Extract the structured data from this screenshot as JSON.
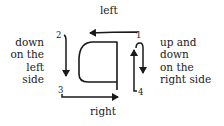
{
  "diagram": {
    "labels": {
      "top": "left",
      "bottom": "right",
      "left_side": [
        "down",
        "on the",
        "left",
        "side"
      ],
      "right_side": [
        "up and",
        "down",
        "on the",
        "right side"
      ]
    },
    "stroke_numbers": [
      "1",
      "2",
      "3",
      "4"
    ],
    "strokes": [
      {
        "number": "1",
        "direction": "left",
        "description": "arrow along top from right to left"
      },
      {
        "number": "2",
        "direction": "down",
        "description": "arrow down on the left side"
      },
      {
        "number": "3",
        "direction": "right",
        "description": "arrow along bottom from left to right"
      },
      {
        "number": "4",
        "direction": "up and down",
        "description": "arrow up then down on the right side"
      }
    ],
    "shape": "letter outline (rounded left, straight right side)",
    "stroke_color": "#1a1a1a"
  }
}
